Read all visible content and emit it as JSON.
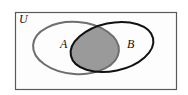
{
  "diagram": {
    "type": "venn",
    "universe_label": "U",
    "sets": [
      {
        "label": "A",
        "outline_color": "#6e6e6e"
      },
      {
        "label": "B",
        "outline_color": "#111111"
      }
    ],
    "shaded_region": "A ∩ B",
    "shade_color": "#9a9a9a",
    "border_color": "#5a5a5a"
  }
}
